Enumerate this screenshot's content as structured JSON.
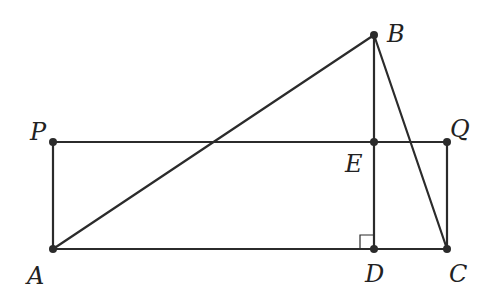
{
  "diagram": {
    "type": "geometry",
    "points": {
      "A": {
        "label": "A",
        "x": 53,
        "y": 249,
        "lx": 27,
        "ly": 284
      },
      "P": {
        "label": "P",
        "x": 53,
        "y": 142,
        "lx": 30,
        "ly": 140
      },
      "B": {
        "label": "B",
        "x": 374,
        "y": 35,
        "lx": 387,
        "ly": 42
      },
      "E": {
        "label": "E",
        "x": 374,
        "y": 142,
        "lx": 345,
        "ly": 172
      },
      "Q": {
        "label": "Q",
        "x": 447,
        "y": 142,
        "lx": 450,
        "ly": 137
      },
      "D": {
        "label": "D",
        "x": 374,
        "y": 249,
        "lx": 365,
        "ly": 282
      },
      "C": {
        "label": "C",
        "x": 447,
        "y": 249,
        "lx": 449,
        "ly": 282
      }
    },
    "segments": [
      [
        "A",
        "P"
      ],
      [
        "P",
        "Q"
      ],
      [
        "Q",
        "C"
      ],
      [
        "A",
        "C"
      ],
      [
        "A",
        "B"
      ],
      [
        "B",
        "D"
      ],
      [
        "B",
        "C"
      ]
    ],
    "right_angle_at": "D",
    "colors": {
      "stroke": "#2b2b2b",
      "background": "#ffffff"
    }
  }
}
